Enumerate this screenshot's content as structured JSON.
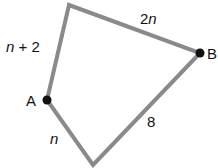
{
  "diagram": {
    "type": "quadrilateral",
    "edge_color": "#8a8a8a",
    "vertex_color": "#111111",
    "vertices": {
      "top": {
        "x": 69,
        "y": 5
      },
      "B": {
        "x": 200,
        "y": 53
      },
      "bottom": {
        "x": 93,
        "y": 165
      },
      "A": {
        "x": 47,
        "y": 100
      }
    },
    "vertex_labels": {
      "A": "A",
      "B": "B"
    },
    "side_labels": {
      "A_top": {
        "var": "n",
        "rest": " + 2"
      },
      "top_B": {
        "coef": "2",
        "var": "n"
      },
      "B_bottom": "8",
      "bottom_A": "n"
    }
  }
}
